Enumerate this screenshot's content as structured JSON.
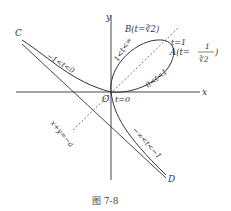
{
  "figure": {
    "caption": "图 7-8",
    "axes": {
      "x_label": "x",
      "y_label": "y",
      "origin_label": "O"
    },
    "points": {
      "A": "A(t=",
      "A_frac_num": "1",
      "A_frac_den": "∛2",
      "A_close": ")",
      "B": "B(t=∛2)",
      "C": "C",
      "D": "D"
    },
    "annotations": {
      "t1": "t=1",
      "t0": "t=0",
      "branch_upper_left": "−1<t<0",
      "loop_upper": "1<t<∞",
      "loop_lower": "0<t<1",
      "branch_lower_right": "−∞<t<−1",
      "asymptote": "x+y=−a"
    },
    "colors": {
      "stroke": "#333333",
      "text": "#333333"
    }
  }
}
